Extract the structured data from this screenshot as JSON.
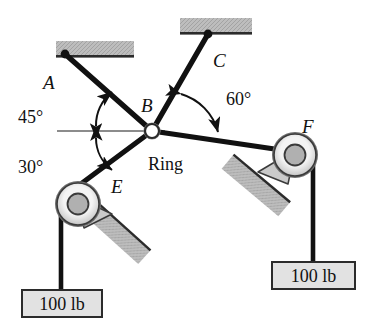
{
  "figure": {
    "type": "statics-free-body-diagram",
    "colors": {
      "cable": "#1a1a1a",
      "support_fill": "#b9b9b9",
      "pulley_hub": "#a8a8a8",
      "pulley_annulus": "#efefef",
      "weight_box_fill": "#e2e2e2",
      "reference_line": "#555555"
    }
  },
  "labels": {
    "point_a": "A",
    "point_b": "B",
    "point_c": "C",
    "point_e": "E",
    "point_f": "F",
    "ring": "Ring"
  },
  "angles": {
    "cable_ba": "45°",
    "cable_be": "30°",
    "cable_bc": "60°"
  },
  "weights": {
    "left": "100 lb",
    "right": "100 lb"
  }
}
